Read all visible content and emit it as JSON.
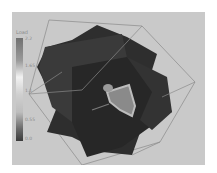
{
  "viewer": {
    "background_color": "#c9c9c9",
    "legend": {
      "title": "Load",
      "ticks": [
        {
          "label": "2.2",
          "pos": 9
        },
        {
          "label": "1.65",
          "pos": 36
        },
        {
          "label": "1.1",
          "pos": 61
        },
        {
          "label": "0.55",
          "pos": 90
        },
        {
          "label": "0.0",
          "pos": 109
        }
      ]
    }
  }
}
